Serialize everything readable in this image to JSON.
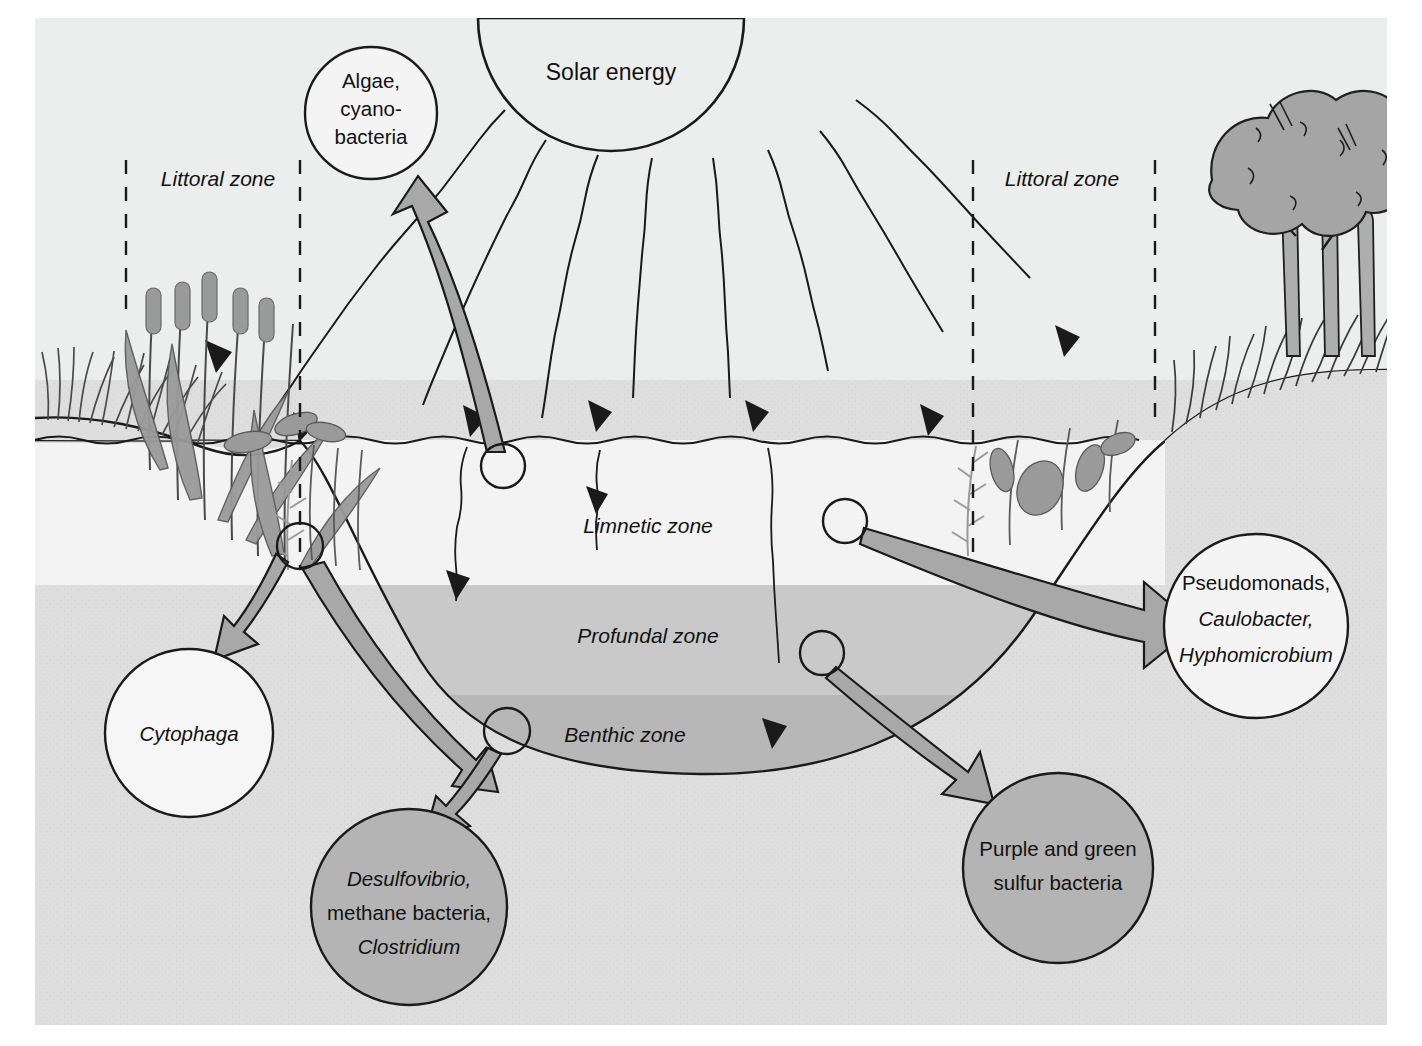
{
  "figure": {
    "type": "ecosystem-cross-section"
  },
  "colors": {
    "page_background": "#ffffff",
    "panel_background": "#e9e9e9",
    "sky": "#eeeeee",
    "limnetic_water": "#f2f2f2",
    "profundal_water": "#c9c9c9",
    "benthic_water": "#b6b6b6",
    "sediment": "#dcdcdc",
    "vegetation": "#9a9a9a",
    "arrow_fill": "#a8a8a8",
    "bubble_light": "#f4f4f4",
    "bubble_dark": "#b4b4b4",
    "outline": "#1a1a1a"
  },
  "sun": {
    "label": "Solar energy"
  },
  "zone_labels": [
    {
      "id": "littoral-left",
      "text": "Littoral zone",
      "x": 218,
      "y": 186
    },
    {
      "id": "littoral-right",
      "text": "Littoral zone",
      "x": 1062,
      "y": 186
    },
    {
      "id": "limnetic",
      "text": "Limnetic zone",
      "x": 648,
      "y": 533
    },
    {
      "id": "profundal",
      "text": "Profundal zone",
      "x": 648,
      "y": 643
    },
    {
      "id": "benthic",
      "text": "Benthic zone",
      "x": 625,
      "y": 742
    }
  ],
  "bubbles": [
    {
      "id": "algae-cyanobacteria",
      "fill": "light",
      "cx": 371,
      "cy": 113,
      "r": 66,
      "lines": [
        {
          "text": "Algae,",
          "italic": false
        },
        {
          "text": "cyano-",
          "italic": false
        },
        {
          "text": "bacteria",
          "italic": false
        }
      ]
    },
    {
      "id": "pseudomonads-caulobacter-hyphomicrobium",
      "fill": "light",
      "cx": 1256,
      "cy": 626,
      "r": 92,
      "lines": [
        {
          "text": "Pseudomonads,",
          "italic": false
        },
        {
          "text": "Caulobacter,",
          "italic": true
        },
        {
          "text": "Hyphomicrobium",
          "italic": true
        }
      ]
    },
    {
      "id": "cytophaga",
      "fill": "light",
      "cx": 189,
      "cy": 733,
      "r": 84,
      "lines": [
        {
          "text": "Cytophaga",
          "italic": true
        }
      ]
    },
    {
      "id": "desulfovibrio-methane-clostridium",
      "fill": "dark",
      "cx": 409,
      "cy": 907,
      "r": 98,
      "lines": [
        {
          "text": "Desulfovibrio,",
          "italic": true
        },
        {
          "text": "methane bacteria,",
          "italic": false
        },
        {
          "text": "Clostridium",
          "italic": true
        }
      ]
    },
    {
      "id": "purple-green-sulfur-bacteria",
      "fill": "dark",
      "cx": 1058,
      "cy": 868,
      "r": 95,
      "lines": [
        {
          "text": "Purple and green",
          "italic": false
        },
        {
          "text": "sulfur bacteria",
          "italic": false
        }
      ]
    }
  ],
  "sample_markers": [
    {
      "id": "marker-surface-algae",
      "cx": 503,
      "cy": 466,
      "r": 22
    },
    {
      "id": "marker-littoral-left",
      "cx": 300,
      "cy": 546,
      "r": 23
    },
    {
      "id": "marker-limnetic-right",
      "cx": 845,
      "cy": 521,
      "r": 22
    },
    {
      "id": "marker-profundal-right",
      "cx": 822,
      "cy": 653,
      "r": 22
    },
    {
      "id": "marker-benthic",
      "cx": 507,
      "cy": 731,
      "r": 23
    }
  ],
  "flow_arrows": [
    {
      "id": "arrow-to-algae",
      "from": "marker-surface-algae",
      "to": "algae-cyanobacteria"
    },
    {
      "id": "arrow-to-cytophaga",
      "from": "marker-littoral-left",
      "to": "cytophaga"
    },
    {
      "id": "arrow-to-benthic-anaerobes",
      "from": "marker-benthic",
      "to": "desulfovibrio-methane-clostridium"
    },
    {
      "id": "arrow-to-pseudomonads",
      "from": "marker-limnetic-right",
      "to": "pseudomonads-caulobacter-hyphomicrobium"
    },
    {
      "id": "arrow-to-sulfur-bacteria",
      "from": "marker-profundal-right",
      "to": "purple-green-sulfur-bacteria"
    }
  ],
  "solar_rays": {
    "count": 8,
    "description": "wavy light rays from sun to water surface and into lake"
  }
}
